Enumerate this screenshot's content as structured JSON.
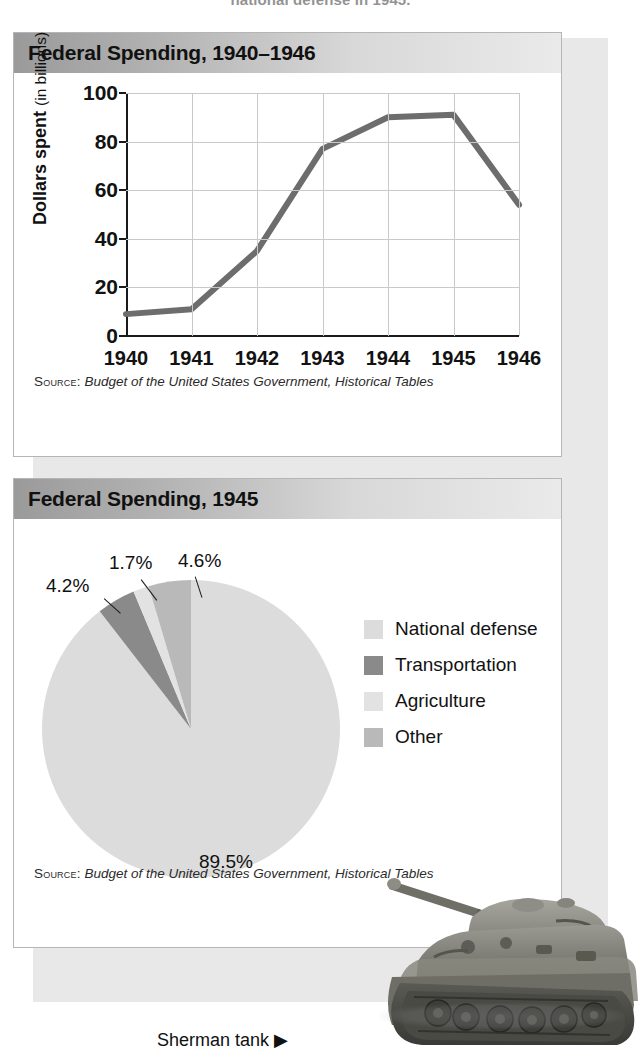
{
  "page": {
    "top_cut_text": "national defense in 1945.",
    "caption": "Sherman tank ▶",
    "caption_arrow_icon": "triangle-right-icon"
  },
  "line_card": {
    "title": "Federal Spending, 1940–1946",
    "source_prefix": "Source:",
    "source_text": "Budget of the United States Government, Historical Tables"
  },
  "pie_card": {
    "title": "Federal Spending, 1945",
    "source_prefix": "Source:",
    "source_text": "Budget of the United States Government, Historical Tables"
  },
  "chart_data": [
    {
      "type": "line",
      "title": "Federal Spending, 1940–1946",
      "xlabel": "",
      "ylabel": "Dollars spent (in billions)",
      "ylabel_bold": "Dollars spent",
      "ylabel_light": "(in billions)",
      "categories": [
        "1940",
        "1941",
        "1942",
        "1943",
        "1944",
        "1945",
        "1946"
      ],
      "values": [
        9,
        11,
        35,
        77,
        90,
        91,
        54
      ],
      "ylim": [
        0,
        100
      ],
      "yticks": [
        0,
        20,
        40,
        60,
        80,
        100
      ],
      "grid": true,
      "legend": "none",
      "line_color": "#6d6d6d"
    },
    {
      "type": "pie",
      "title": "Federal Spending, 1945",
      "labels": [
        "National defense",
        "Transportation",
        "Agriculture",
        "Other"
      ],
      "values": [
        89.5,
        4.2,
        1.7,
        4.6
      ],
      "value_labels": [
        "89.5%",
        "4.2%",
        "1.7%",
        "4.6%"
      ],
      "colors": [
        "#dcdcdc",
        "#8a8a8a",
        "#e2e2e2",
        "#b9b9b9"
      ],
      "legend": "right",
      "start_angle_deg": 0
    }
  ],
  "colors": {
    "panel_bg": "#e8e8e8",
    "card_bg": "#ffffff",
    "title_bar_dark": "#9a9a9a",
    "title_bar_light": "#eaeaea",
    "grid": "#c9c9c9",
    "axis": "#1a1a1a",
    "line": "#6d6d6d"
  }
}
